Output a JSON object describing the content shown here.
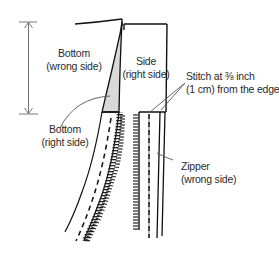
{
  "diagram": {
    "colors": {
      "ink": "#111111",
      "leader": "#555555",
      "dimension": "#777777",
      "shade": "#d9d9d9",
      "background": "#ffffff"
    },
    "labels": {
      "bottom_wrong": {
        "line1": "Bottom",
        "line2": "(wrong side)"
      },
      "bottom_right": {
        "line1": "Bottom",
        "line2": "(right side)"
      },
      "side_right": {
        "line1": "Side",
        "line2": "(right side)"
      },
      "stitch": {
        "line1": "Stitch at ⅜ inch",
        "line2": "(1 cm) from the edge"
      },
      "zipper": {
        "line1": "Zipper",
        "line2": "(wrong side)"
      }
    },
    "elements": [
      {
        "id": "dimension-arrow",
        "type": "vertical double arrow",
        "icon": "double-arrow-icon"
      },
      {
        "id": "bottom-panel",
        "type": "panel outline"
      },
      {
        "id": "side-panel",
        "type": "panel outline"
      },
      {
        "id": "zipper-teeth-left",
        "type": "zipper teeth"
      },
      {
        "id": "zipper-teeth-right",
        "type": "zipper teeth"
      },
      {
        "id": "stitch-lines",
        "type": "dashed stitching"
      }
    ]
  }
}
